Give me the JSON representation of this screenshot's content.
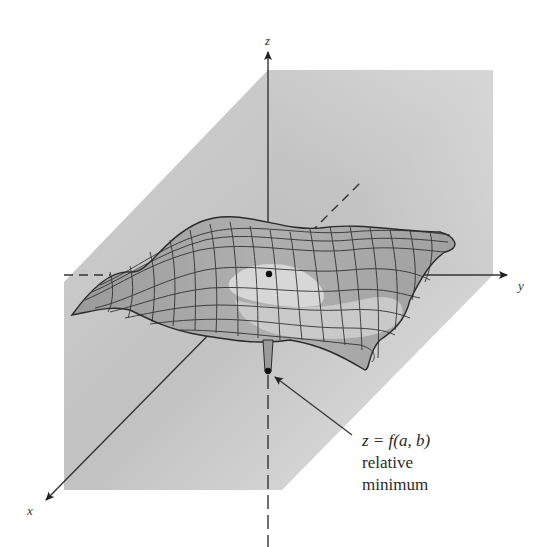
{
  "figure": {
    "type": "3d-surface-diagram",
    "colors": {
      "background": "#ffffff",
      "plane_light": "#e6e6e6",
      "plane_dark": "#b4b4b4",
      "surface_fill": "#a9a9a9",
      "surface_highlight": "#dcdcdc",
      "mesh_line": "#2b2b2b",
      "axis": "#333333"
    }
  },
  "axes": {
    "z_label": "z",
    "y_label": "y",
    "x_label": "x"
  },
  "annotation": {
    "equation": "z = f(a, b)",
    "line1": "relative",
    "line2": "minimum"
  }
}
